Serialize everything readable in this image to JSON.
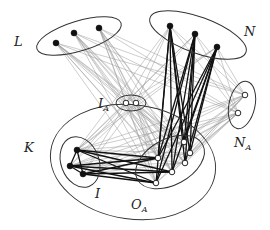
{
  "diagram": {
    "type": "graph-partition",
    "labels": {
      "L": {
        "main": "L",
        "sub": ""
      },
      "N": {
        "main": "N",
        "sub": ""
      },
      "IA": {
        "main": "I",
        "sub": "A"
      },
      "NA": {
        "main": "N",
        "sub": "A"
      },
      "K": {
        "main": "K",
        "sub": ""
      },
      "I": {
        "main": "I",
        "sub": ""
      },
      "OA": {
        "main": "O",
        "sub": "A"
      }
    },
    "groups": [
      {
        "id": "L",
        "fill": "black",
        "nodes": [
          [
            56,
            43
          ],
          [
            74,
            33
          ],
          [
            99,
            28
          ]
        ]
      },
      {
        "id": "N",
        "fill": "black",
        "nodes": [
          [
            170,
            26
          ],
          [
            195,
            34
          ],
          [
            217,
            47
          ]
        ]
      },
      {
        "id": "IA",
        "fill": "white",
        "nodes": [
          [
            126,
            103
          ],
          [
            136,
            103
          ]
        ]
      },
      {
        "id": "NA",
        "fill": "white",
        "nodes": [
          [
            245,
            95
          ],
          [
            238,
            113
          ]
        ]
      },
      {
        "id": "I",
        "fill": "black",
        "nodes": [
          [
            77,
            150
          ],
          [
            70,
            166
          ],
          [
            83,
            174
          ]
        ]
      },
      {
        "id": "OA",
        "fill": "white",
        "nodes": [
          [
            158,
            158
          ],
          [
            156,
            183
          ],
          [
            172,
            172
          ],
          [
            184,
            142
          ],
          [
            185,
            163
          ],
          [
            190,
            153
          ]
        ]
      }
    ],
    "colors": {
      "thin_edge": "#9a9a9a",
      "thick_edge": "#111111",
      "ellipse": "#333333"
    }
  }
}
